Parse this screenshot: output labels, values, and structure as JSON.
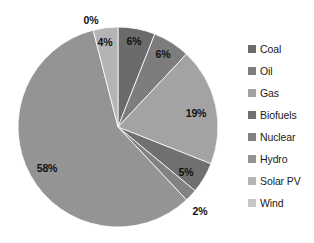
{
  "chart_data": {
    "type": "pie",
    "title": "",
    "xlabel": "",
    "ylabel": "",
    "legend_position": "right",
    "grid": false,
    "categories": [
      "Coal",
      "Oil",
      "Gas",
      "Biofuels",
      "Nuclear",
      "Hydro",
      "Solar PV",
      "Wind"
    ],
    "values": [
      6,
      6,
      19,
      5,
      2,
      58,
      4,
      0
    ],
    "labels": [
      "6%",
      "6%",
      "19%",
      "5%",
      "2%",
      "58%",
      "4%",
      "0%"
    ],
    "colors": [
      "#6b6b6b",
      "#7d7d7d",
      "#a3a3a3",
      "#707070",
      "#828282",
      "#949494",
      "#b4b4b4",
      "#c6c6c6"
    ],
    "slices": [
      {
        "name": "Coal",
        "value": 6,
        "label": "6%",
        "color": "#6b6b6b",
        "label_x": 134,
        "label_y": 41,
        "label_inside": true
      },
      {
        "name": "Oil",
        "value": 6,
        "label": "6%",
        "color": "#7d7d7d",
        "label_x": 163,
        "label_y": 54,
        "label_inside": true
      },
      {
        "name": "Gas",
        "value": 19,
        "label": "19%",
        "color": "#a3a3a3",
        "label_x": 196,
        "label_y": 113,
        "label_inside": true
      },
      {
        "name": "Biofuels",
        "value": 5,
        "label": "5%",
        "color": "#707070",
        "label_x": 186,
        "label_y": 172,
        "label_inside": true
      },
      {
        "name": "Nuclear",
        "value": 2,
        "label": "2%",
        "color": "#828282",
        "label_x": 200,
        "label_y": 211,
        "label_inside": false
      },
      {
        "name": "Hydro",
        "value": 58,
        "label": "58%",
        "color": "#949494",
        "label_x": 47,
        "label_y": 168,
        "label_inside": true
      },
      {
        "name": "Solar PV",
        "value": 4,
        "label": "4%",
        "color": "#b4b4b4",
        "label_x": 105,
        "label_y": 42,
        "label_inside": true
      },
      {
        "name": "Wind",
        "value": 0,
        "label": "0%",
        "color": "#c6c6c6",
        "label_x": 91,
        "label_y": 20,
        "label_inside": false
      }
    ],
    "geometry": {
      "center_x": 118,
      "center_y": 127,
      "radius": 100,
      "start_angle_deg": 0,
      "direction": "clockwise"
    }
  },
  "legend": {
    "items": [
      {
        "label": "Coal",
        "color": "#6b6b6b"
      },
      {
        "label": "Oil",
        "color": "#7d7d7d"
      },
      {
        "label": "Gas",
        "color": "#a3a3a3"
      },
      {
        "label": "Biofuels",
        "color": "#707070"
      },
      {
        "label": "Nuclear",
        "color": "#828282"
      },
      {
        "label": "Hydro",
        "color": "#949494"
      },
      {
        "label": "Solar PV",
        "color": "#b4b4b4"
      },
      {
        "label": "Wind",
        "color": "#c6c6c6"
      }
    ]
  }
}
